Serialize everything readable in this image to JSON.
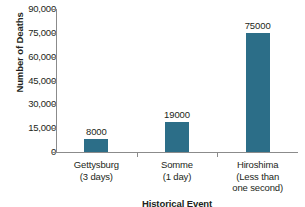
{
  "chart_data": {
    "type": "bar",
    "title": "",
    "xlabel": "Historical Event",
    "ylabel": "Number of Deaths",
    "categories": [
      "Gettysburg\n(3 days)",
      "Somme\n(1 day)",
      "Hiroshima\n(Less than\none second)"
    ],
    "category_lines": [
      [
        "Gettysburg",
        "(3 days)"
      ],
      [
        "Somme",
        "(1 day)"
      ],
      [
        "Hiroshima",
        "(Less than",
        "one second)"
      ]
    ],
    "values": [
      8000,
      19000,
      75000
    ],
    "data_labels": [
      "8000",
      "19000",
      "75000"
    ],
    "ylim": [
      0,
      90000
    ],
    "ytick_values": [
      90000,
      75000,
      60000,
      45000,
      30000,
      15000,
      0
    ],
    "ytick_labels": [
      "90,000",
      "75,000",
      "60,000",
      "45,000",
      "30,000",
      "15,000",
      "0"
    ],
    "grid": false,
    "legend": null,
    "bar_color": "#2c6e88",
    "axis_color": "#8b8b8b",
    "text_color": "#231f20"
  }
}
